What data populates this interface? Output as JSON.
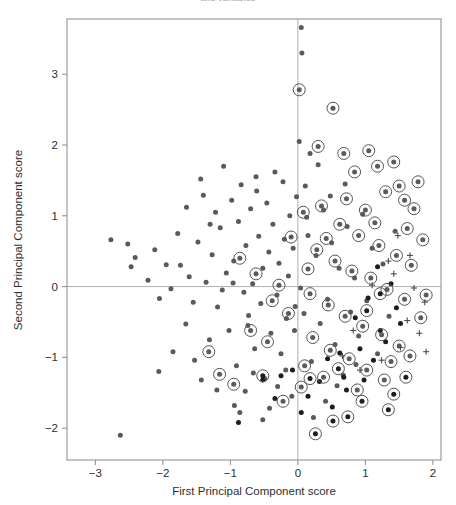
{
  "figure": {
    "top_fragment_text": "and variables",
    "background_color": "#ffffff",
    "frame_color": "#8a8a8a",
    "zero_line_color": "#b0b0b0"
  },
  "axes": {
    "x_title": "First Principal Component score",
    "y_title": "Second Principal Component score",
    "x_ticks": [
      "-3",
      "-2",
      "-1",
      "0",
      "1",
      "2"
    ],
    "y_ticks": [
      "3",
      "2",
      "1",
      "0",
      "-1",
      "-2"
    ]
  },
  "chart_data": {
    "type": "scatter",
    "title": "",
    "xlabel": "First Principal Component score",
    "ylabel": "Second Principal Component score",
    "xlim": [
      -3.42,
      2.12
    ],
    "ylim": [
      -2.45,
      3.78
    ],
    "xticks": [
      -3,
      -2,
      -1,
      0,
      1,
      2
    ],
    "yticks": [
      -2,
      -1,
      0,
      1,
      2,
      3
    ],
    "grid": false,
    "legend": null,
    "reference_lines": [
      {
        "axis": "x",
        "value": 0,
        "color": "#b0b0b0"
      },
      {
        "axis": "y",
        "value": 0,
        "color": "#b0b0b0"
      }
    ],
    "marker_styles": {
      "dot": {
        "shape": "filled-circle",
        "color": "#5a5a5a",
        "size": 5.0
      },
      "dot_dark": {
        "shape": "filled-circle",
        "color": "#1d1d1d",
        "size": 5.0
      },
      "circled": {
        "shape": "filled-circle-with-ring",
        "color": "#5a5a5a",
        "ring_color": "#555555",
        "size": 5.0,
        "ring_size": 12
      },
      "circled_dark": {
        "shape": "filled-circle-with-ring",
        "color": "#1d1d1d",
        "ring_color": "#555555",
        "size": 5.0,
        "ring_size": 12
      },
      "plus": {
        "shape": "plus",
        "color": "#4a4a4a",
        "size": 6
      }
    },
    "series": [
      {
        "name": "plain",
        "marker": "dot",
        "points": [
          [
            0.05,
            3.66
          ],
          [
            -2.63,
            -2.1
          ],
          [
            -2.77,
            0.66
          ],
          [
            -2.52,
            0.6
          ],
          [
            -2.47,
            0.28
          ],
          [
            -2.41,
            0.41
          ],
          [
            -2.22,
            0.09
          ],
          [
            -2.12,
            0.52
          ],
          [
            -2.05,
            -0.17
          ],
          [
            -1.95,
            0.31
          ],
          [
            -1.88,
            -0.03
          ],
          [
            -1.78,
            0.75
          ],
          [
            -1.74,
            0.3
          ],
          [
            -1.66,
            -0.53
          ],
          [
            -1.61,
            0.14
          ],
          [
            -1.55,
            -0.22
          ],
          [
            -1.48,
            0.63
          ],
          [
            -1.44,
            1.52
          ],
          [
            -1.4,
            1.29
          ],
          [
            -1.36,
            0.06
          ],
          [
            -1.31,
            -0.75
          ],
          [
            -1.27,
            0.45
          ],
          [
            -1.22,
            1.05
          ],
          [
            -1.19,
            -0.29
          ],
          [
            -1.15,
            0.83
          ],
          [
            -1.1,
            1.7
          ],
          [
            -1.06,
            0.19
          ],
          [
            -1.02,
            -0.62
          ],
          [
            -0.98,
            1.22
          ],
          [
            -0.95,
            0.36
          ],
          [
            -0.91,
            -1.12
          ],
          [
            -0.88,
            0.92
          ],
          [
            -0.84,
            1.44
          ],
          [
            -0.8,
            -0.08
          ],
          [
            -0.77,
            0.58
          ],
          [
            -0.73,
            -0.41
          ],
          [
            -0.7,
            1.1
          ],
          [
            -0.67,
            0.04
          ],
          [
            -0.64,
            -0.88
          ],
          [
            -0.61,
            1.35
          ],
          [
            -0.58,
            0.71
          ],
          [
            -0.55,
            -0.24
          ],
          [
            -0.52,
            0.26
          ],
          [
            -0.49,
            -1.3
          ],
          [
            -0.46,
            1.18
          ],
          [
            -0.43,
            0.49
          ],
          [
            -0.4,
            -0.66
          ],
          [
            -0.37,
            0.88
          ],
          [
            -0.34,
            1.62
          ],
          [
            -0.31,
            -0.12
          ],
          [
            -0.28,
            0.33
          ],
          [
            -0.25,
            -0.95
          ],
          [
            -0.22,
            1.48
          ],
          [
            -0.2,
            0.67
          ],
          [
            -0.17,
            -0.45
          ],
          [
            -0.14,
            0.15
          ],
          [
            -0.12,
            1.0
          ],
          [
            -0.09,
            -1.55
          ],
          [
            -0.07,
            0.54
          ],
          [
            -0.04,
            -0.28
          ],
          [
            -0.02,
            1.27
          ],
          [
            -1.43,
            -1.32
          ],
          [
            -1.53,
            -1.04
          ],
          [
            -1.2,
            -1.46
          ],
          [
            -0.94,
            -1.68
          ],
          [
            -0.66,
            -1.22
          ],
          [
            -0.52,
            -1.88
          ],
          [
            -0.3,
            -1.41
          ],
          [
            -2.06,
            -1.2
          ],
          [
            -1.85,
            -0.92
          ],
          [
            -0.86,
            -1.78
          ],
          [
            -0.74,
            -0.55
          ],
          [
            -1.65,
            1.12
          ],
          [
            -1.12,
            -0.05
          ],
          [
            -0.96,
            0.05
          ],
          [
            -0.78,
            -1.48
          ],
          [
            -0.42,
            -1.72
          ],
          [
            -0.18,
            -1.18
          ],
          [
            -0.62,
            1.55
          ],
          [
            -1.3,
            0.88
          ],
          [
            0.02,
            2.05
          ],
          [
            0.11,
            1.42
          ],
          [
            0.09,
            -0.38
          ],
          [
            0.15,
            0.72
          ],
          [
            0.2,
            -1.06
          ],
          [
            0.27,
            0.44
          ],
          [
            0.33,
            -0.52
          ],
          [
            0.38,
            1.08
          ],
          [
            0.44,
            -0.18
          ],
          [
            0.5,
            0.62
          ],
          [
            0.55,
            -0.82
          ],
          [
            0.61,
            0.26
          ],
          [
            0.67,
            -1.25
          ],
          [
            0.73,
            0.85
          ],
          [
            0.78,
            -0.36
          ],
          [
            0.84,
            0.12
          ],
          [
            0.9,
            -0.7
          ],
          [
            0.96,
            1.02
          ],
          [
            1.02,
            -0.2
          ],
          [
            1.1,
            0.54
          ],
          [
            1.18,
            -0.95
          ],
          [
            1.26,
            0.32
          ],
          [
            1.35,
            -0.42
          ],
          [
            1.44,
            0.78
          ],
          [
            0.06,
            3.3
          ],
          [
            0.23,
            -1.85
          ],
          [
            0.41,
            -1.62
          ],
          [
            0.58,
            -1.4
          ],
          [
            0.3,
            1.72
          ],
          [
            0.48,
            1.28
          ],
          [
            0.7,
            1.45
          ],
          [
            0.86,
            -1.1
          ],
          [
            -0.05,
            -0.62
          ],
          [
            0.04,
            -0.02
          ],
          [
            0.13,
            0.98
          ],
          [
            0.18,
            1.88
          ]
        ]
      },
      {
        "name": "plain-dark",
        "marker": "dot_dark",
        "points": [
          [
            -0.88,
            -1.92
          ],
          [
            -0.52,
            -1.32
          ],
          [
            -0.25,
            -1.26
          ],
          [
            -0.08,
            -1.18
          ],
          [
            0.15,
            -1.55
          ],
          [
            0.32,
            -1.34
          ],
          [
            0.51,
            -1.7
          ],
          [
            0.68,
            -1.28
          ],
          [
            0.85,
            -0.44
          ],
          [
            1.04,
            -0.16
          ],
          [
            1.22,
            -0.62
          ],
          [
            1.38,
            0.04
          ],
          [
            1.46,
            -0.3
          ],
          [
            0.92,
            -0.88
          ],
          [
            1.12,
            -1.04
          ],
          [
            0.44,
            -1.02
          ],
          [
            -0.34,
            -1.58
          ],
          [
            0.62,
            -0.94
          ],
          [
            1.3,
            -0.78
          ],
          [
            1.52,
            -0.52
          ],
          [
            0.05,
            -1.78
          ],
          [
            0.72,
            -1.46
          ],
          [
            1.18,
            0.28
          ],
          [
            0.98,
            -1.32
          ]
        ]
      },
      {
        "name": "circled",
        "marker": "circled",
        "points": [
          [
            0.02,
            2.78
          ],
          [
            0.52,
            2.52
          ],
          [
            0.84,
            1.62
          ],
          [
            1.18,
            1.7
          ],
          [
            1.5,
            1.42
          ],
          [
            1.72,
            1.1
          ],
          [
            0.72,
            1.24
          ],
          [
            1.0,
            1.08
          ],
          [
            1.3,
            1.34
          ],
          [
            1.62,
            0.82
          ],
          [
            1.85,
            0.66
          ],
          [
            0.35,
            1.14
          ],
          [
            0.62,
            0.88
          ],
          [
            0.9,
            0.72
          ],
          [
            1.2,
            0.58
          ],
          [
            1.46,
            0.44
          ],
          [
            1.68,
            0.3
          ],
          [
            0.28,
            0.52
          ],
          [
            0.55,
            0.36
          ],
          [
            0.8,
            0.22
          ],
          [
            1.08,
            0.12
          ],
          [
            1.32,
            -0.04
          ],
          [
            1.58,
            -0.18
          ],
          [
            0.18,
            -0.1
          ],
          [
            0.45,
            -0.26
          ],
          [
            0.7,
            -0.42
          ],
          [
            0.96,
            -0.56
          ],
          [
            1.24,
            -0.68
          ],
          [
            1.5,
            -0.84
          ],
          [
            0.22,
            -0.72
          ],
          [
            0.48,
            -0.9
          ],
          [
            0.76,
            -1.02
          ],
          [
            1.02,
            -1.18
          ],
          [
            1.28,
            -1.32
          ],
          [
            0.1,
            -1.12
          ],
          [
            0.38,
            -1.28
          ],
          [
            0.05,
            -1.42
          ],
          [
            -0.14,
            -0.38
          ],
          [
            -0.38,
            -0.2
          ],
          [
            -0.62,
            0.18
          ],
          [
            -0.86,
            0.4
          ],
          [
            -0.7,
            -0.62
          ],
          [
            -0.45,
            -0.78
          ],
          [
            -0.22,
            -1.62
          ],
          [
            -0.1,
            0.7
          ],
          [
            0.08,
            1.05
          ],
          [
            0.3,
            1.98
          ],
          [
            0.68,
            1.88
          ],
          [
            1.05,
            1.92
          ],
          [
            1.42,
            1.76
          ],
          [
            1.78,
            1.48
          ],
          [
            1.58,
            1.22
          ],
          [
            1.9,
            -0.12
          ],
          [
            1.82,
            -0.44
          ],
          [
            1.66,
            -0.98
          ],
          [
            1.38,
            -1.06
          ],
          [
            -0.95,
            -1.38
          ],
          [
            -1.16,
            -1.24
          ],
          [
            -1.32,
            -0.92
          ],
          [
            0.88,
            -1.46
          ],
          [
            1.14,
            0.9
          ],
          [
            0.42,
            0.68
          ],
          [
            0.15,
            0.25
          ],
          [
            -0.28,
            0.02
          ]
        ]
      },
      {
        "name": "circled-dark",
        "marker": "circled_dark",
        "points": [
          [
            0.18,
            -1.3
          ],
          [
            0.26,
            -2.08
          ],
          [
            0.52,
            -1.9
          ],
          [
            1.42,
            -1.52
          ],
          [
            1.6,
            -1.28
          ],
          [
            1.34,
            -1.74
          ],
          [
            0.95,
            -1.62
          ],
          [
            -0.52,
            -1.26
          ],
          [
            0.74,
            -1.84
          ],
          [
            1.02,
            -0.34
          ],
          [
            1.22,
            -0.1
          ],
          [
            0.6,
            -1.16
          ]
        ]
      },
      {
        "name": "plus",
        "marker": "plus",
        "points": [
          [
            1.48,
            0.72
          ],
          [
            1.72,
            -0.02
          ],
          [
            1.88,
            -0.22
          ],
          [
            1.62,
            -0.48
          ],
          [
            1.34,
            0.36
          ],
          [
            1.8,
            -0.66
          ],
          [
            1.1,
            0.02
          ],
          [
            1.52,
            -0.86
          ],
          [
            0.92,
            -1.18
          ],
          [
            1.24,
            -1.04
          ],
          [
            0.66,
            -0.98
          ],
          [
            1.42,
            0.18
          ],
          [
            1.66,
            0.44
          ],
          [
            0.82,
            -0.62
          ],
          [
            1.9,
            -0.92
          ]
        ]
      }
    ]
  }
}
